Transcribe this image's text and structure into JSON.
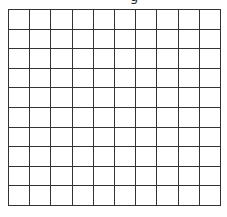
{
  "title_fragment": "g",
  "grid": {
    "rows": 10,
    "columns": 10,
    "line_color": "#333333",
    "fill_color": "#ffffff"
  }
}
